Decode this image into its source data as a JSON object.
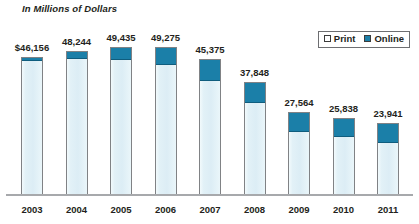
{
  "chart_data": {
    "type": "bar",
    "title": "In Millions of Dollars",
    "xlabel": "",
    "ylabel": "",
    "stacked": true,
    "grid": false,
    "legend_position": "top-right",
    "ylim": [
      0,
      50000
    ],
    "categories": [
      "2003",
      "2004",
      "2005",
      "2006",
      "2007",
      "2008",
      "2009",
      "2010",
      "2011"
    ],
    "total_labels": [
      "$46,156",
      "48,244",
      "49,435",
      "49,275",
      "45,375",
      "37,848",
      "27,564",
      "25,838",
      "23,941"
    ],
    "totals": [
      46156,
      48244,
      49435,
      49275,
      45375,
      37848,
      27564,
      25838,
      23941
    ],
    "series": [
      {
        "name": "Print",
        "color": "#e2f1f7",
        "values": [
          44956,
          45844,
          45435,
          43775,
          38575,
          31048,
          21464,
          19638,
          17741
        ]
      },
      {
        "name": "Online",
        "color": "#1b7fa8",
        "values": [
          1200,
          2400,
          4000,
          5500,
          6800,
          6800,
          6100,
          6200,
          6200
        ]
      }
    ]
  },
  "legend": {
    "items": [
      {
        "label": "Print",
        "color": "#ffffff"
      },
      {
        "label": "Online",
        "color": "#1b7fa8"
      }
    ]
  },
  "colors": {
    "online": "#1b7fa8",
    "print": "#e2f1f7",
    "bar_outline": "#808285",
    "axis": "#a7a9ac",
    "text": "#231f20"
  }
}
